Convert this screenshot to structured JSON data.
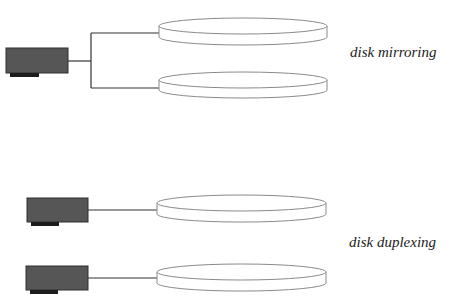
{
  "labels": {
    "mirroring": "disk mirroring",
    "duplexing": "disk duplexing"
  },
  "colors": {
    "controller_fill": "#565656",
    "controller_border": "#2e2e2e",
    "controller_strip": "#1c1c1c",
    "wire": "#333333",
    "disk_stroke": "#8a8a8a",
    "disk_fill": "#ffffff"
  },
  "sections": [
    {
      "name": "disk mirroring",
      "controllers": 1,
      "disks": 2
    },
    {
      "name": "disk duplexing",
      "controllers": 2,
      "disks": 2
    }
  ]
}
